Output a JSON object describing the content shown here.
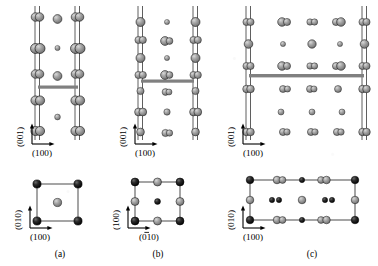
{
  "figure": {
    "type": "crystal-structure-diagram",
    "background_color": "#ffffff",
    "atom_gray_color": "#8c8c8c",
    "atom_dark_color": "#1a1a1a",
    "bar_color": "#808080",
    "line_color": "#4d4d4d"
  },
  "panels": [
    {
      "id": "a",
      "caption": "(a)",
      "upper": {
        "axis_vertical_label": "(001)",
        "axis_horizontal_label": "(100)",
        "column_count": 2,
        "bar_present": true
      },
      "cell": {
        "axis_vertical_label": "(010)",
        "axis_horizontal_label": "(100)",
        "shape": "square",
        "corner_atoms": 4,
        "center_atoms": 1
      }
    },
    {
      "id": "b",
      "caption": "(b)",
      "upper": {
        "axis_vertical_label": "(001)",
        "axis_horizontal_label": "(100)",
        "column_count": 2,
        "bar_present": true
      },
      "cell": {
        "axis_vertical_label": "(100)",
        "axis_horizontal_label": "(010)",
        "axis_horizontal_overbar_index": 1,
        "shape": "square",
        "corner_atoms": 4,
        "edge_atoms": 4,
        "center_atoms": 1
      }
    },
    {
      "id": "c",
      "caption": "(c)",
      "upper": {
        "axis_vertical_label": "(001)",
        "axis_horizontal_label": "(100)",
        "column_count": 2,
        "bar_present": true
      },
      "cell": {
        "axis_vertical_label": "(010)",
        "axis_horizontal_label": "(100)",
        "shape": "rectangle",
        "corner_atoms": 4,
        "edge_atoms": 10,
        "center_atoms": 3
      }
    }
  ]
}
